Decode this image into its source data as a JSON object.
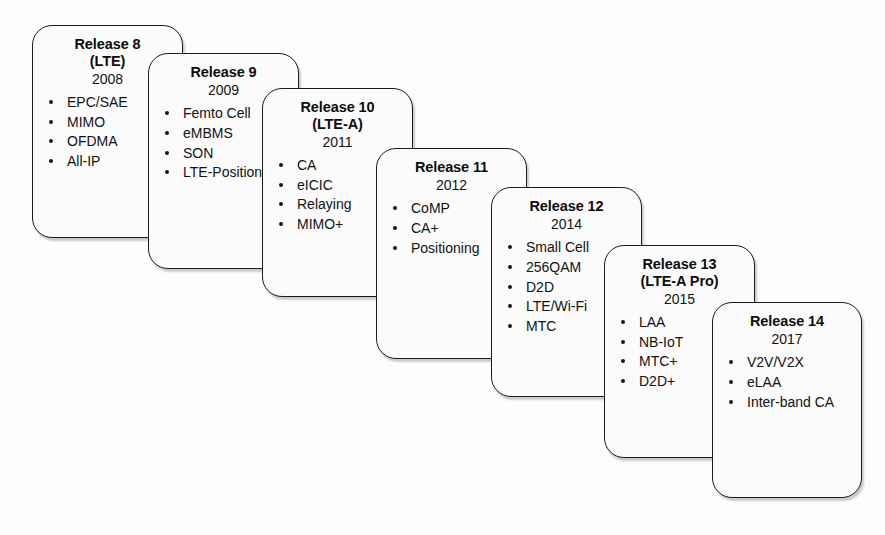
{
  "figure": {
    "type": "timeline-roadmap",
    "orientation": "diagonal-descending",
    "background_color": "#ffffff",
    "box_border_color": "#1b1b1b",
    "box_fill_color": "#fbfbfb",
    "text_color": "#121212"
  },
  "boxes": [
    {
      "title": "Release 8",
      "subtitle": "(LTE)",
      "year": "2008",
      "features": [
        "EPC/SAE",
        "MIMO",
        "OFDMA",
        "All-IP"
      ],
      "x": 32,
      "y": 25,
      "width": 151,
      "height": 213
    },
    {
      "title": "Release 9",
      "subtitle": "",
      "year": "2009",
      "features": [
        "Femto Cell",
        "eMBMS",
        "SON",
        "LTE-Positioning"
      ],
      "x": 148,
      "y": 53,
      "width": 151,
      "height": 216
    },
    {
      "title": "Release 10",
      "subtitle": "(LTE-A)",
      "year": "2011",
      "features": [
        "CA",
        "eICIC",
        "Relaying",
        "MIMO+"
      ],
      "x": 262,
      "y": 88,
      "width": 151,
      "height": 209
    },
    {
      "title": "Release 11",
      "subtitle": "",
      "year": "2012",
      "features": [
        "CoMP",
        "CA+",
        "Positioning"
      ],
      "x": 376,
      "y": 148,
      "width": 151,
      "height": 211
    },
    {
      "title": "Release 12",
      "subtitle": "",
      "year": "2014",
      "features": [
        "Small Cell",
        "256QAM",
        "D2D",
        "LTE/Wi-Fi",
        "MTC"
      ],
      "x": 491,
      "y": 187,
      "width": 151,
      "height": 210
    },
    {
      "title": "Release 13",
      "subtitle": "(LTE-A Pro)",
      "year": "2015",
      "features": [
        "LAA",
        "NB-IoT",
        "MTC+",
        "D2D+"
      ],
      "x": 604,
      "y": 245,
      "width": 151,
      "height": 213
    },
    {
      "title": "Release 14",
      "subtitle": "",
      "year": "2017",
      "features": [
        "V2V/V2X",
        "eLAA",
        "Inter-band CA"
      ],
      "x": 712,
      "y": 302,
      "width": 150,
      "height": 196
    }
  ],
  "caption": ""
}
